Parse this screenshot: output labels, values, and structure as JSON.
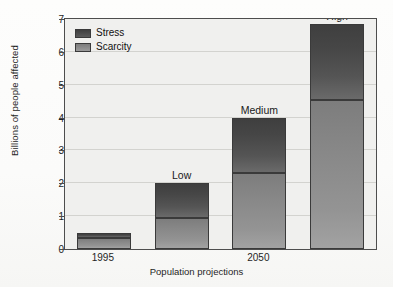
{
  "chart_data": {
    "type": "bar",
    "subtype": "stacked-bar",
    "title": "",
    "xlabel": "Population projections",
    "ylabel": "Billions of people affected",
    "ylim": [
      0,
      7
    ],
    "yticks": [
      0,
      1,
      2,
      3,
      4,
      5,
      6,
      7
    ],
    "ytick_labels": [
      "0",
      "1",
      "2",
      "3",
      "4",
      "5",
      "6",
      "7"
    ],
    "grid": true,
    "grid_axis": "y",
    "categories": [
      "1995",
      "Low",
      "Medium",
      "High"
    ],
    "xtick_labels": [
      "1995",
      "2050"
    ],
    "bar_annotations": [
      "",
      "Low",
      "Medium",
      "High"
    ],
    "legend_position": "upper-left-inside",
    "series": [
      {
        "name": "Scarcity",
        "color": "#8c8c8c",
        "values": [
          0.35,
          0.95,
          2.3,
          4.55
        ]
      },
      {
        "name": "Stress",
        "color": "#4a4a4a",
        "values": [
          0.15,
          1.05,
          1.7,
          2.3
        ]
      }
    ],
    "totals": [
      0.5,
      2.0,
      4.0,
      6.85
    ]
  },
  "legend": {
    "items": [
      {
        "label": "Stress",
        "swatch": "legend-swatch-stress"
      },
      {
        "label": "Scarcity",
        "swatch": "legend-swatch-scarcity"
      }
    ]
  },
  "axes": {
    "y_title": "Billions of people affected",
    "x_title": "Population projections"
  },
  "colors": {
    "stress": "#4a4a4a",
    "scarcity": "#8c8c8c",
    "plot_background": "#f0f0ee",
    "frame": "#4d4d4d",
    "gridline": "#d3d3cf"
  }
}
